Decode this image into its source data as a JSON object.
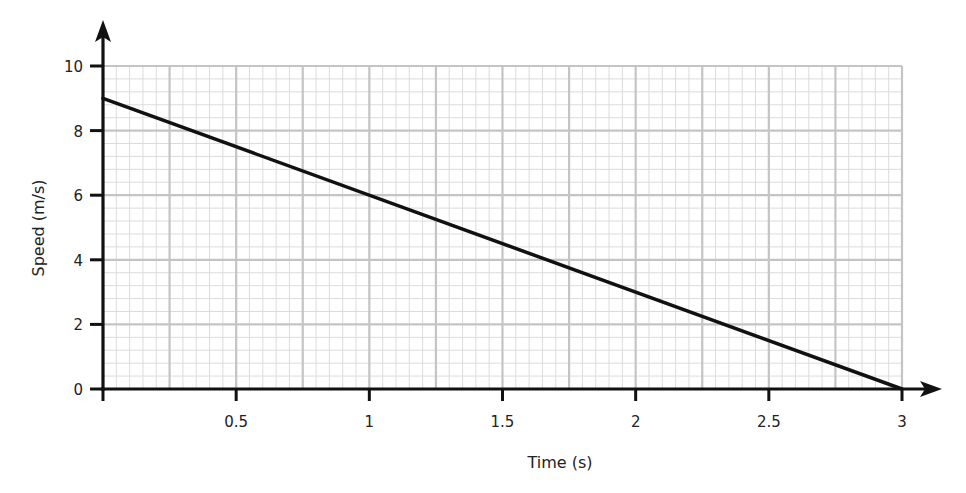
{
  "chart_data": {
    "type": "line",
    "title": "",
    "xlabel": "Time (s)",
    "ylabel": "Speed (m/s)",
    "xlim": [
      0,
      3
    ],
    "ylim": [
      0,
      10
    ],
    "x_ticks": [
      0.5,
      1,
      1.5,
      2,
      2.5,
      3
    ],
    "x_tick_labels": [
      "0.5",
      "1",
      "1.5",
      "2",
      "2.5",
      "3"
    ],
    "y_ticks": [
      0,
      2,
      4,
      6,
      8,
      10
    ],
    "y_tick_labels": [
      "0",
      "2",
      "4",
      "6",
      "8",
      "10"
    ],
    "grid": true,
    "grid_style": "graph paper: major x every 0.25 s, minor every 0.05 s; major y every 2 m/s, minor every 0.4 m/s",
    "series": [
      {
        "name": "speed",
        "x": [
          0,
          3
        ],
        "y": [
          9,
          0
        ],
        "color": "#111111"
      }
    ],
    "legend": null
  },
  "colors": {
    "axis": "#111111",
    "grid_major": "#c4c4c4",
    "grid_minor": "#dcdcdc",
    "line": "#111111",
    "background": "#ffffff"
  }
}
